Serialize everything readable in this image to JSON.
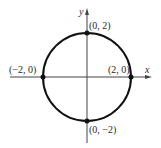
{
  "diagram": {
    "type": "circle-graph",
    "equation_implied": "x^2 + y^2 = 4",
    "axes": {
      "x_label": "x",
      "y_label": "y"
    },
    "circle": {
      "center": [
        0,
        0
      ],
      "radius": 2
    },
    "points": [
      {
        "label": "(0, 2)",
        "x": 0,
        "y": 2
      },
      {
        "label": "(−2, 0)",
        "x": -2,
        "y": 0
      },
      {
        "label": "(2, 0)",
        "x": 2,
        "y": 0
      },
      {
        "label": "(0, −2)",
        "x": 0,
        "y": -2
      }
    ],
    "colors": {
      "curve": "#111111",
      "axes": "#444444",
      "text": "#2a2a2a"
    }
  }
}
